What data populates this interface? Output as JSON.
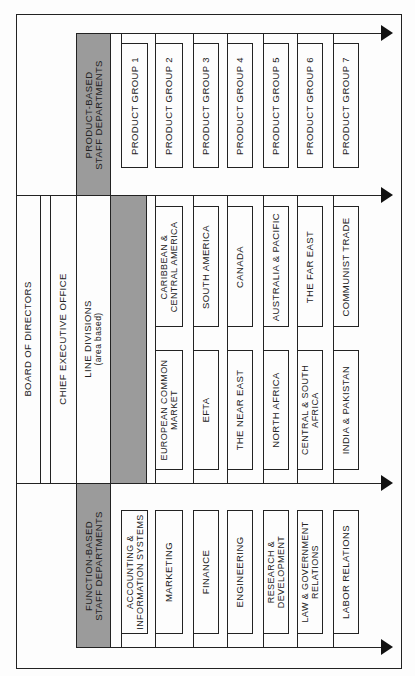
{
  "colors": {
    "gray_header": "#9b9b9b",
    "line": "#222222",
    "background": "#fdfdfd"
  },
  "levels": {
    "board": "BOARD OF DIRECTORS",
    "ceo": "CHIEF EXECUTIVE OFFICE",
    "line_divisions": {
      "title": "LINE DIVISIONS",
      "subtitle": "(area based)"
    }
  },
  "product_section": {
    "header_line1": "PRODUCT-BASED",
    "header_line2": "STAFF DEPARTMENTS",
    "items": [
      "PRODUCT GROUP 1",
      "PRODUCT GROUP 2",
      "PRODUCT GROUP 3",
      "PRODUCT GROUP 4",
      "PRODUCT GROUP 5",
      "PRODUCT GROUP 6",
      "PRODUCT GROUP 7"
    ]
  },
  "line_section": {
    "upper_items": [
      [
        "CARIBBEAN &",
        "CENTRAL AMERICA"
      ],
      [
        "SOUTH AMERICA",
        ""
      ],
      [
        "CANADA",
        ""
      ],
      [
        "AUSTRALIA & PACIFIC",
        ""
      ],
      [
        "THE FAR EAST",
        ""
      ],
      [
        "COMMUNIST TRADE",
        ""
      ]
    ],
    "lower_items": [
      [
        "EUROPEAN COMMON",
        "MARKET"
      ],
      [
        "EFTA",
        ""
      ],
      [
        "THE NEAR EAST",
        ""
      ],
      [
        "NORTH AFRICA",
        ""
      ],
      [
        "CENTRAL & SOUTH",
        "AFRICA"
      ],
      [
        "INDIA & PAKISTAN",
        ""
      ]
    ]
  },
  "function_section": {
    "header_line1": "FUNCTION-BASED",
    "header_line2": "STAFF DEPARTMENTS",
    "items": [
      [
        "ACCOUNTING &",
        "INFORMATION SYSTEMS"
      ],
      [
        "MARKETING",
        ""
      ],
      [
        "FINANCE",
        ""
      ],
      [
        "ENGINEERING",
        ""
      ],
      [
        "RESEARCH &",
        "DEVELOPMENT"
      ],
      [
        "LAW & GOVERNMENT",
        "RELATIONS"
      ],
      [
        "LABOR RELATIONS",
        ""
      ]
    ]
  }
}
